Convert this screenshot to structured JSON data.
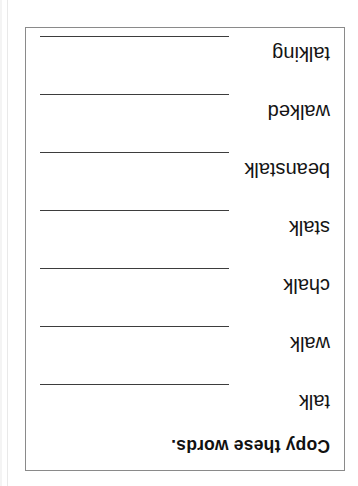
{
  "page": {
    "background_color": "#ffffff",
    "orientation": "upside-down",
    "rotation_degrees": 180
  },
  "worksheet": {
    "border_color": "#8a8a8a",
    "title": "Copy these words.",
    "line_color": "#3d3d3d",
    "text_color": "#141414",
    "rows": [
      {
        "word": "talk"
      },
      {
        "word": "walk"
      },
      {
        "word": "chalk"
      },
      {
        "word": "stalk"
      },
      {
        "word": "beanstalk"
      },
      {
        "word": "walked"
      },
      {
        "word": "talking"
      }
    ]
  }
}
